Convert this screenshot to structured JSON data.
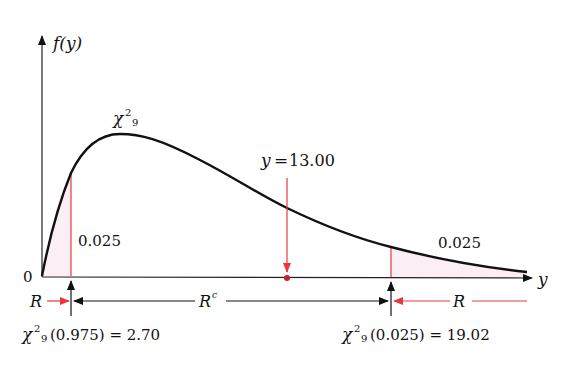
{
  "axes": {
    "y_label": "f(y)",
    "x_label": "y",
    "origin_label": "0"
  },
  "distribution": {
    "symbol": "χ",
    "superscript": "2",
    "subscript": "9",
    "degrees_of_freedom": 9
  },
  "observed": {
    "label_var": "y",
    "label_eq": "=",
    "value": "13.00"
  },
  "left_tail": {
    "area_label": "0.025",
    "critical_expr": "(0.975) = 2.70",
    "critical_value": 2.7,
    "region_label": "R"
  },
  "right_tail": {
    "area_label": "0.025",
    "critical_expr": "(0.025) = 19.02",
    "critical_value": 19.02,
    "region_label": "R"
  },
  "acceptance_region": {
    "label": "R",
    "superscript": "c"
  },
  "colors": {
    "curve": "#111111",
    "axis": "#222222",
    "accent_red": "#e8383d",
    "tail_fill": "#fbeef5"
  }
}
